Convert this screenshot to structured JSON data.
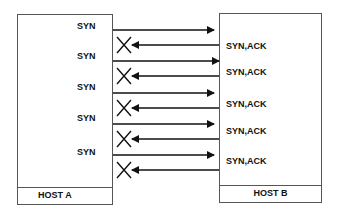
{
  "diagram": {
    "type": "sequence",
    "host_a": {
      "label": "HOST A"
    },
    "host_b": {
      "label": "HOST B"
    },
    "exchanges": [
      {
        "request": "SYN",
        "response": "SYN,ACK",
        "response_dropped": true
      },
      {
        "request": "SYN",
        "response": "SYN,ACK",
        "response_dropped": true
      },
      {
        "request": "SYN",
        "response": "SYN,ACK",
        "response_dropped": true
      },
      {
        "request": "SYN",
        "response": "SYN,ACK",
        "response_dropped": true
      },
      {
        "request": "SYN",
        "response": "SYN,ACK",
        "response_dropped": true
      }
    ],
    "colors": {
      "line": "#111111",
      "border": "#555555",
      "background": "#ffffff"
    }
  }
}
